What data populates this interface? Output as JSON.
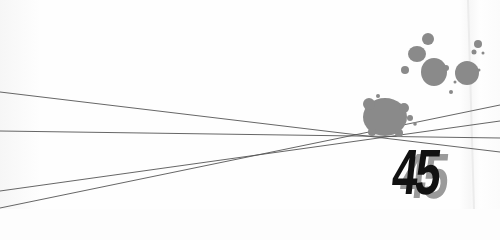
{
  "page": {
    "number": "45",
    "background_color": "#fdfdfd",
    "ink_color": "#111111",
    "splatter_color": "#8a8a8a",
    "shadow_color": "#9a9a9a"
  }
}
